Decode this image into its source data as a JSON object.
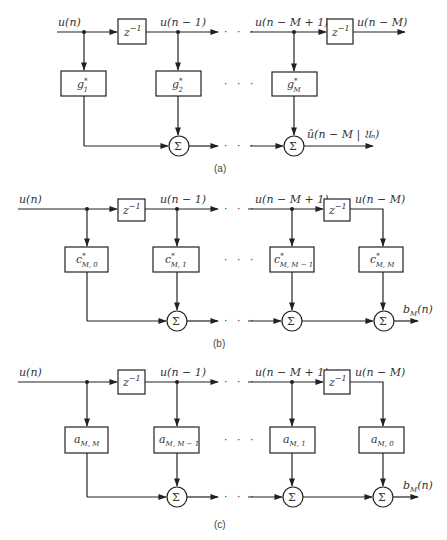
{
  "figure": {
    "panels": [
      {
        "id": "a",
        "label": "(a)",
        "input_label": "u(n)",
        "delay_label": "z",
        "delay_exp": "−1",
        "tap1_label": "u(n − 1)",
        "tapM1_label": "u(n − M + 1)",
        "tapM_label": "u(n − M)",
        "weights": [
          {
            "base": "g",
            "sub": "1",
            "sup": "*"
          },
          {
            "base": "g",
            "sub": "2",
            "sup": "*"
          },
          {
            "base": "g",
            "sub": "M",
            "sup": "*"
          }
        ],
        "sum_symbol": "Σ",
        "output_label": "û(n − M | 𝔘ₙ)",
        "ellipsis": "· · ·"
      },
      {
        "id": "b",
        "label": "(b)",
        "input_label": "u(n)",
        "delay_label": "z",
        "delay_exp": "−1",
        "tap1_label": "u(n − 1)",
        "tapM1_label": "u(n − M + 1)",
        "tapM_label": "u(n − M)",
        "weights": [
          {
            "base": "c",
            "sub": "M, 0",
            "sup": "*"
          },
          {
            "base": "c",
            "sub": "M, 1",
            "sup": "*"
          },
          {
            "base": "c",
            "sub": "M, M − 1",
            "sup": "*"
          },
          {
            "base": "c",
            "sub": "M, M",
            "sup": "*"
          }
        ],
        "sum_symbol": "Σ",
        "output_label_base": "b",
        "output_label_sub": "M",
        "output_label_arg": "(n)",
        "ellipsis": "· · ·"
      },
      {
        "id": "c",
        "label": "(c)",
        "input_label": "u(n)",
        "delay_label": "z",
        "delay_exp": "−1",
        "tap1_label": "u(n − 1)",
        "tapM1_label": "u(n − M + 1)",
        "tapM_label": "u(n − M)",
        "weights": [
          {
            "base": "a",
            "sub": "M, M",
            "sup": ""
          },
          {
            "base": "a",
            "sub": "M, M − 1",
            "sup": ""
          },
          {
            "base": "a",
            "sub": "M, 1",
            "sup": ""
          },
          {
            "base": "a",
            "sub": "M, 0",
            "sup": ""
          }
        ],
        "sum_symbol": "Σ",
        "output_label_base": "b",
        "output_label_sub": "M",
        "output_label_arg": "(n)",
        "ellipsis": "· · ·"
      }
    ]
  }
}
